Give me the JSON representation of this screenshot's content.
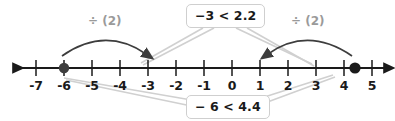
{
  "diagram": {
    "type": "number-line",
    "axis": {
      "min": -7,
      "max": 5,
      "tick_labels": [
        "-7",
        "-6",
        "-5",
        "-4",
        "-3",
        "-2",
        "-1",
        "0",
        "1",
        "2",
        "3",
        "4",
        "5"
      ],
      "tick_values": [
        -7,
        -6,
        -5,
        -4,
        -3,
        -2,
        -1,
        0,
        1,
        2,
        3,
        4,
        5
      ],
      "left_arrow": true,
      "right_arrow": true,
      "axis_color": "#1a1a1a"
    },
    "points": [
      {
        "name": "left-point",
        "value": -6,
        "label": "-6",
        "color": "#3d3d3d"
      },
      {
        "name": "right-point",
        "value": 4.4,
        "label": "4.4",
        "color": "#1a1a1a"
      }
    ],
    "operations": [
      {
        "name": "divide-left",
        "label": "÷ (2)",
        "from": -6,
        "to": -3,
        "color": "#9a9a9a"
      },
      {
        "name": "divide-right",
        "label": "÷ (2)",
        "from": 4.4,
        "to": 2,
        "color": "#9a9a9a"
      }
    ],
    "callouts": [
      {
        "name": "result-inequality",
        "text": "−3 < 2.2",
        "position": "top",
        "points_to": [
          -3,
          2
        ]
      },
      {
        "name": "original-inequality",
        "text": "− 6 < 4.4",
        "position": "bottom",
        "points_to": [
          -6,
          4.4
        ]
      }
    ],
    "colors": {
      "text": "#1a1a1a",
      "gray": "#9a9a9a",
      "leader": "#d0d0d0",
      "border": "#cfcfcf"
    }
  }
}
